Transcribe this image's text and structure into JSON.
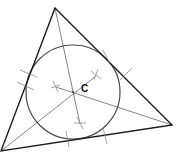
{
  "diagram": {
    "title": "",
    "center_label": "C",
    "colors": {
      "triangle": "#1a1a1a",
      "circle": "#4a4a4a",
      "bisector": "#777777",
      "tick": "#8a8a8a"
    },
    "triangle": {
      "vertices": [
        [
          55,
          8
        ],
        [
          172,
          125
        ],
        [
          1,
          151
        ]
      ]
    },
    "incircle": {
      "cx": 73,
      "cy": 92,
      "r": 47
    }
  }
}
